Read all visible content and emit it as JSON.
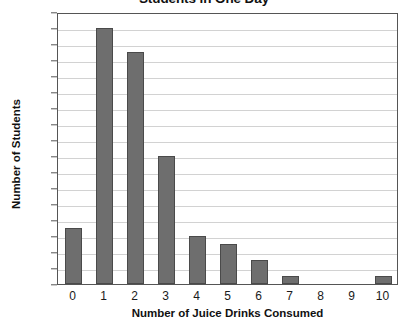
{
  "chart_data": {
    "type": "bar",
    "title": "Students in One Day",
    "xlabel": "Number of Juice Drinks Consumed",
    "ylabel": "Number of Students",
    "categories": [
      "0",
      "1",
      "2",
      "3",
      "4",
      "5",
      "6",
      "7",
      "8",
      "9",
      "10"
    ],
    "values": [
      7,
      32,
      29,
      16,
      6,
      5,
      3,
      1,
      0,
      0,
      1
    ],
    "ylim": [
      0,
      34
    ],
    "ytick_step": 2,
    "yticks": [
      0,
      2,
      4,
      6,
      8,
      10,
      12,
      14,
      16,
      18,
      20,
      22,
      24,
      26,
      28,
      30,
      32,
      34
    ],
    "grid": true,
    "legend": "none",
    "colors": {
      "bar_fill": "#6e6e6e",
      "bar_border": "#4a4a4a",
      "gridline": "#d2d2d2",
      "frame": "#555555",
      "text": "#1a1a1a"
    }
  }
}
